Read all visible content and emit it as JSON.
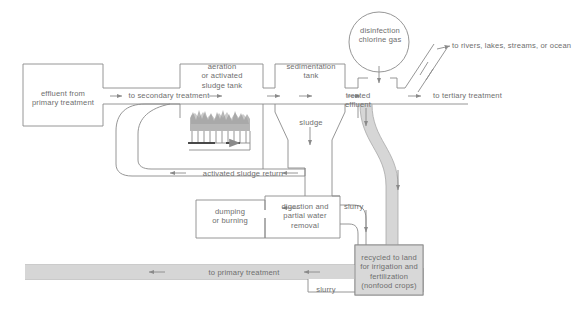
{
  "diagram": {
    "colors": {
      "line": "#8a8a8a",
      "text": "#6e6e6e",
      "slurry_band": "#d6d6d6",
      "slurry_band_edge": "#9a9a9a",
      "recycled_box_fill": "#d8d8d8",
      "aeration_bubbles": "#9e9e9e",
      "background": "#ffffff"
    },
    "boxes": {
      "effluent_primary": "effluent from\nprimary treatment",
      "aeration_tank": "aeration\nor activated\nsludge tank",
      "sedimentation_tank": "sedimentation\ntank",
      "dumping_or_burning": "dumping\nor burning",
      "digestion": "digestion and\npartial water\nremoval",
      "recycled_land": "recycled to land\nfor irrigation and\nfertilization\n(nonfood crops)",
      "disinfection": "disinfection\nchlorine gas"
    },
    "flow_labels": {
      "to_secondary_treatment": "to secondary treatment",
      "treated_effluent": "treated\neffluent",
      "to_rivers": "to rivers, lakes, streams, or ocean",
      "to_tertiary_treatment": "to tertiary treatment",
      "sludge": "sludge",
      "activated_sludge_return": "activated sludge return",
      "slurry_upper": "slurry",
      "to_primary_treatment": "to primary treatment",
      "slurry_lower": "slurry"
    }
  }
}
